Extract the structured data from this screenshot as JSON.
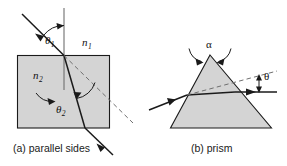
{
  "figure": {
    "background_color": "#ffffff",
    "medium_fill_color": "#d4d4d4",
    "stroke_color": "#1a1a1a",
    "panels": [
      {
        "id": "parallel-sides",
        "caption": "(a) parallel sides",
        "shape": "rectangle",
        "labels": {
          "incident_angle": "θ",
          "incident_angle_sub": "1",
          "refracted_angle": "θ",
          "refracted_angle_sub": "2",
          "index_outside": "n",
          "index_outside_sub": "1",
          "index_inside": "n",
          "index_inside_sub": "2"
        }
      },
      {
        "id": "prism",
        "caption": "(b) prism",
        "shape": "triangle",
        "labels": {
          "apex_angle": "α",
          "deviation_angle": "θ"
        }
      }
    ]
  }
}
